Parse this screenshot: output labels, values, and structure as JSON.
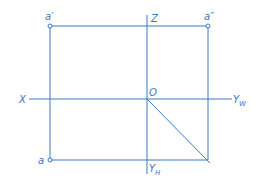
{
  "diagram": {
    "type": "orthographic-projection-of-point",
    "color": "#3a78c0",
    "axes": {
      "x": {
        "label": "X"
      },
      "z": {
        "label": "Z"
      },
      "origin": {
        "label": "O"
      },
      "yw": {
        "label": "Y",
        "sub": "W"
      },
      "yh": {
        "label": "Y",
        "sub": "H"
      }
    },
    "points": {
      "front": {
        "label": "a′"
      },
      "side": {
        "label": "a″"
      },
      "top": {
        "label": "a"
      }
    }
  }
}
